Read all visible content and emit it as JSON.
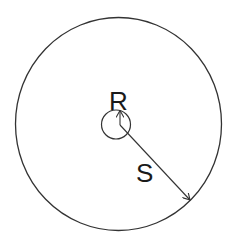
{
  "diagram": {
    "type": "concentric-circles-radii",
    "outer_circle": {
      "label": "S",
      "cx": 118.5,
      "cy": 124,
      "rx": 103,
      "ry": 106.5
    },
    "inner_circle": {
      "label": "R",
      "cx": 116,
      "cy": 124.5,
      "r": 14.5
    },
    "labels": {
      "inner_radius": "R",
      "outer_radius": "S"
    },
    "colors": {
      "stroke": "#333333",
      "text": "#1a1a1a",
      "background": "#ffffff"
    }
  }
}
